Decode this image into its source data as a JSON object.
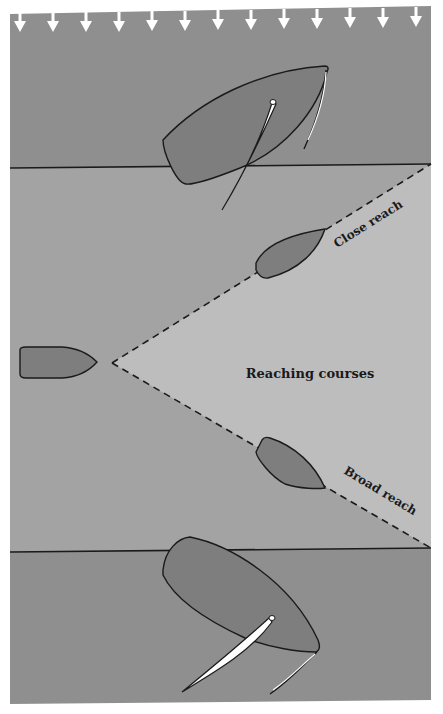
{
  "diagram": {
    "title": "Reaching courses",
    "labels": {
      "center": "Reaching courses",
      "close_reach": "Close reach",
      "broad_reach": "Broad reach"
    },
    "wind_arrow_count": 13,
    "wind_direction": "down",
    "colors": {
      "background": "#ffffff",
      "zone_dark": "#8f8f8f",
      "zone_mid": "#a3a3a3",
      "zone_light": "#bdbdbd",
      "hull": "#7e7e7e",
      "outline": "#1a1a1a",
      "sail": "#ffffff",
      "arrow": "#ffffff"
    },
    "icons": [
      "wind-arrow-icon",
      "sailboat-icon",
      "boat-hull-icon"
    ]
  }
}
